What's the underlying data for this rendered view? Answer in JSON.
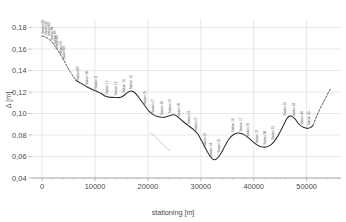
{
  "chart_data": {
    "type": "line",
    "title": "",
    "xlabel": "stationing [m]",
    "ylabel": "Δ  [m]",
    "xlim": [
      -2000,
      56500
    ],
    "ylim": [
      0.04,
      0.188
    ],
    "grid": true,
    "legend": "none",
    "xticks": [
      0,
      10000,
      20000,
      30000,
      40000,
      50000
    ],
    "xtick_labels": [
      "0",
      "10000",
      "20000",
      "30000",
      "40000",
      "50000"
    ],
    "yticks": [
      0.04,
      0.06,
      0.08,
      0.1,
      0.12,
      0.14,
      0.16,
      0.18
    ],
    "ytick_labels": [
      "0,04",
      "0,06",
      "0,08",
      "0,10",
      "0,12",
      "0,14",
      "0,16",
      "0,18"
    ],
    "minor_tick_interval_x": 2000,
    "series": [
      {
        "name": "main-profile-solid",
        "style": "solid",
        "x": [
          6400,
          7200,
          8000,
          8800,
          9600,
          10400,
          11200,
          12000,
          12800,
          13600,
          14400,
          15200,
          16000,
          16600,
          17200,
          17800,
          18600,
          19400,
          20200,
          21000,
          21800,
          22600,
          23400,
          24200,
          24800,
          25400,
          26200,
          27000,
          27800,
          28600,
          29400,
          30200,
          31000,
          31800,
          32400,
          33000,
          33800,
          34600,
          35400,
          36200,
          37000,
          37800,
          38600,
          39400,
          40200,
          41000,
          41800,
          42600,
          43400,
          44200,
          45000,
          45800,
          46400,
          47000,
          47800,
          48600,
          49400,
          50200,
          50800,
          51200
        ],
        "y": [
          0.131,
          0.1285,
          0.1262,
          0.124,
          0.1222,
          0.1206,
          0.1186,
          0.116,
          0.1152,
          0.115,
          0.1148,
          0.1158,
          0.119,
          0.1208,
          0.1205,
          0.118,
          0.1128,
          0.1075,
          0.1022,
          0.099,
          0.0972,
          0.0965,
          0.0968,
          0.0982,
          0.0988,
          0.0978,
          0.0945,
          0.0912,
          0.0882,
          0.0852,
          0.0812,
          0.0742,
          0.0665,
          0.06,
          0.0572,
          0.0578,
          0.0628,
          0.0702,
          0.0768,
          0.0805,
          0.0818,
          0.0812,
          0.079,
          0.0758,
          0.0722,
          0.0698,
          0.0688,
          0.0692,
          0.0716,
          0.0762,
          0.083,
          0.0908,
          0.0962,
          0.0978,
          0.095,
          0.0898,
          0.0872,
          0.0862,
          0.0872,
          0.0888
        ],
        "comment": "solid measured profile"
      },
      {
        "name": "head-extrapolation-dashed",
        "style": "dashed",
        "x": [
          0,
          600,
          1200,
          1800,
          2400,
          3000,
          3600,
          4200,
          4800,
          5400,
          6000,
          6400
        ],
        "y": [
          0.1722,
          0.1712,
          0.1695,
          0.1668,
          0.163,
          0.1588,
          0.154,
          0.1488,
          0.1432,
          0.1382,
          0.1338,
          0.131
        ]
      },
      {
        "name": "tail-extrapolation-dashed",
        "style": "dashed",
        "x": [
          51200,
          51800,
          52400,
          53000,
          53600,
          54200,
          54600
        ],
        "y": [
          0.0888,
          0.0962,
          0.103,
          0.109,
          0.1145,
          0.1205,
          0.1232
        ]
      },
      {
        "name": "secondary-short-dotted",
        "style": "dotted",
        "x": [
          20500,
          21400,
          22200,
          23000,
          23700,
          24100
        ],
        "y": [
          0.0822,
          0.0785,
          0.0745,
          0.0705,
          0.0672,
          0.0655
        ]
      }
    ],
    "point_labels": [
      {
        "x": 350,
        "y": 0.1722,
        "text": "Station 01"
      },
      {
        "x": 900,
        "y": 0.1712,
        "text": "Station 02"
      },
      {
        "x": 1450,
        "y": 0.17,
        "text": "Station 03"
      },
      {
        "x": 2000,
        "y": 0.166,
        "text": "Station 04"
      },
      {
        "x": 2550,
        "y": 0.1622,
        "text": "Station 05"
      },
      {
        "x": 3100,
        "y": 0.158,
        "text": "Station 06"
      },
      {
        "x": 3700,
        "y": 0.1528,
        "text": "Station 07"
      },
      {
        "x": 4300,
        "y": 0.1478,
        "text": "Station 08"
      },
      {
        "x": 7000,
        "y": 0.129,
        "text": "Station 09"
      },
      {
        "x": 8700,
        "y": 0.1245,
        "text": "Station 10"
      },
      {
        "x": 10400,
        "y": 0.1208,
        "text": "Station 11"
      },
      {
        "x": 12400,
        "y": 0.1158,
        "text": "Station 12"
      },
      {
        "x": 14100,
        "y": 0.1148,
        "text": "Station 13"
      },
      {
        "x": 15600,
        "y": 0.1168,
        "text": "Station 14"
      },
      {
        "x": 17000,
        "y": 0.1205,
        "text": "Station 15"
      },
      {
        "x": 19600,
        "y": 0.1062,
        "text": "Station 16"
      },
      {
        "x": 21200,
        "y": 0.0985,
        "text": "Station 17"
      },
      {
        "x": 22800,
        "y": 0.0965,
        "text": "Station 18"
      },
      {
        "x": 24300,
        "y": 0.0982,
        "text": "Station 19"
      },
      {
        "x": 26100,
        "y": 0.0948,
        "text": "Station 20"
      },
      {
        "x": 27900,
        "y": 0.088,
        "text": "Station 21"
      },
      {
        "x": 29300,
        "y": 0.0815,
        "text": "Station 22"
      },
      {
        "x": 30900,
        "y": 0.0668,
        "text": "Station 23"
      },
      {
        "x": 32200,
        "y": 0.0578,
        "text": "Station 24"
      },
      {
        "x": 33600,
        "y": 0.0615,
        "text": "Station 25"
      },
      {
        "x": 36200,
        "y": 0.0805,
        "text": "Station 26"
      },
      {
        "x": 37700,
        "y": 0.0812,
        "text": "Station 27"
      },
      {
        "x": 39200,
        "y": 0.0762,
        "text": "Station 28"
      },
      {
        "x": 40900,
        "y": 0.07,
        "text": "Station 29"
      },
      {
        "x": 42300,
        "y": 0.069,
        "text": "Station 30"
      },
      {
        "x": 43900,
        "y": 0.0735,
        "text": "Station 31"
      },
      {
        "x": 46200,
        "y": 0.096,
        "text": "Station 32"
      },
      {
        "x": 47800,
        "y": 0.095,
        "text": "Station 33"
      },
      {
        "x": 49300,
        "y": 0.0872,
        "text": "Station 34"
      },
      {
        "x": 50700,
        "y": 0.087,
        "text": "Station 35"
      }
    ]
  }
}
